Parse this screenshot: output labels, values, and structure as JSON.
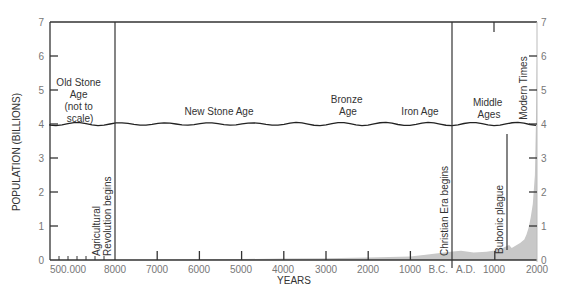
{
  "chart_data": {
    "type": "area",
    "title": "",
    "xlabel": "YEARS",
    "ylabel": "POPULATION (BILLIONS)",
    "ylim": [
      0,
      7
    ],
    "yticks": [
      0,
      1,
      2,
      3,
      4,
      5,
      6,
      7
    ],
    "ytick_labels": [
      "0",
      "1",
      "2",
      "3",
      "4",
      "5",
      "6",
      "7"
    ],
    "xtick_labels": [
      "500.000",
      "8000",
      "7000",
      "6000",
      "5000",
      "4000",
      "3000",
      "2000",
      "1000",
      "B.C.",
      "A.D.",
      "1000",
      "2000"
    ],
    "x_axis_note": "Old Stone Age segment (500,000 to 8000 B.C.) not to scale",
    "axis_break_marker": "wavy line at population 4 separating era labels",
    "grid": false,
    "legend": "none",
    "series": [
      {
        "name": "World population",
        "x": [
          -8000,
          -7000,
          -6000,
          -5000,
          -4000,
          -3000,
          -2000,
          -1000,
          0,
          200,
          500,
          800,
          1000,
          1200,
          1340,
          1400,
          1500,
          1600,
          1700,
          1750,
          1800,
          1850,
          1900,
          1950,
          1975,
          2000
        ],
        "values": [
          0.005,
          0.01,
          0.02,
          0.03,
          0.04,
          0.05,
          0.07,
          0.1,
          0.25,
          0.27,
          0.22,
          0.24,
          0.28,
          0.36,
          0.44,
          0.35,
          0.43,
          0.5,
          0.6,
          0.75,
          0.95,
          1.25,
          1.65,
          2.5,
          4.0,
          6.1
        ]
      }
    ],
    "old_stone_age_values": [
      0.001,
      0.001,
      0.002,
      0.002,
      0.003,
      0.004
    ],
    "eras": [
      {
        "label_lines": [
          "Old Stone",
          "Age",
          "(not to",
          "scale)"
        ]
      },
      {
        "label_lines": [
          "New Stone Age"
        ]
      },
      {
        "label_lines": [
          "Bronze",
          "Age"
        ]
      },
      {
        "label_lines": [
          "Iron Age"
        ]
      },
      {
        "label_lines": [
          "Middle",
          "Ages"
        ]
      },
      {
        "label_lines": [
          "Modern Times"
        ],
        "vertical": true
      }
    ],
    "annotations": [
      {
        "label_lines": [
          "Agricultural",
          "Revolution begins"
        ],
        "year": -8000
      },
      {
        "label_lines": [
          "Christian Era begins"
        ],
        "year": 0
      },
      {
        "label_lines": [
          "Bubonic plague"
        ],
        "year": 1340
      }
    ],
    "colors": {
      "area_fill": "#c8c8c8",
      "axis": "#333333",
      "tick_label": "#777777"
    }
  }
}
